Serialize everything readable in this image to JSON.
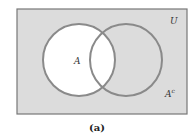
{
  "diagram": {
    "type": "venn",
    "universe_label": "U",
    "set_a_label": "A",
    "complement_label": "A",
    "complement_sup": "c",
    "caption": "(a)",
    "colors": {
      "universe_fill": "#dcdcdc",
      "universe_border": "#777777",
      "set_a_fill": "#ffffff",
      "circle_stroke": "#8a8a8a"
    }
  }
}
